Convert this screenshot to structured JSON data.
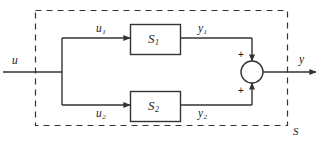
{
  "diagram": {
    "colors": {
      "line": "#333333",
      "dashed_border": "#333333",
      "text": "#1a1a1a",
      "background": "#ffffff",
      "block_fill": "#ffffff"
    },
    "system_boundary": {
      "label": "S",
      "style": "dashed"
    },
    "input": {
      "label": "u",
      "sublabel": ""
    },
    "output": {
      "label": "y",
      "sublabel": ""
    },
    "branches": [
      {
        "input_label": "u",
        "input_sublabel": "1",
        "block_label": "S",
        "block_sublabel": "1",
        "output_label": "y",
        "output_sublabel": "1",
        "sign": "+"
      },
      {
        "input_label": "u",
        "input_sublabel": "2",
        "block_label": "S",
        "block_sublabel": "2",
        "output_label": "y",
        "output_sublabel": "2",
        "sign": "+"
      }
    ],
    "summing_junction": {
      "name": "summing-junction",
      "top_sign": "+",
      "bottom_sign": "+"
    }
  }
}
